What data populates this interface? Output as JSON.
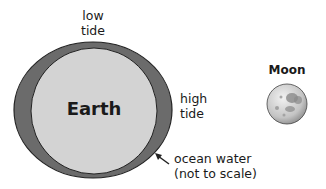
{
  "labels": {
    "low_tide": [
      "low",
      "tide"
    ],
    "high_tide": [
      "high",
      "tide"
    ],
    "earth": "Earth",
    "moon": "Moon",
    "ocean_water": [
      "ocean water",
      "(not to scale)"
    ]
  },
  "colors": {
    "ocean": "#6b6b6b",
    "earth": "#d3d3d3",
    "outline": "#222222",
    "moon_base": "#cfcfcf",
    "moon_spots": "#8a8a8a"
  }
}
